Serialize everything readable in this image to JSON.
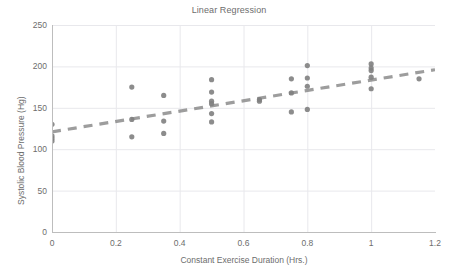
{
  "chart_data": {
    "type": "scatter",
    "title": "Linear Regression",
    "xlabel": "Constant Exercise Duration (Hrs.)",
    "ylabel": "Systolic Blood Pressure (Hg)",
    "xlim": [
      0,
      1.2
    ],
    "ylim": [
      0,
      250
    ],
    "xticks": [
      0,
      0.2,
      0.4,
      0.6,
      0.8,
      1,
      1.2
    ],
    "xtick_labels": [
      "0",
      "0.2",
      "0.4",
      "0.6",
      "0.8",
      "1",
      "1.2"
    ],
    "yticks": [
      0,
      50,
      100,
      150,
      200,
      250
    ],
    "ytick_labels": [
      "0",
      "50",
      "100",
      "150",
      "200",
      "250"
    ],
    "grid": true,
    "legend": null,
    "marker_color": "#808080",
    "trendline_color": "#8c8c8c",
    "grid_color": "#e8e8ec",
    "axis_color": "#bdbdbd",
    "text_color": "#6d6d6d",
    "background": "#ffffff",
    "series": [
      {
        "name": "Observations",
        "marker": "circle",
        "points": [
          [
            0.0,
            130
          ],
          [
            0.0,
            116
          ],
          [
            0.0,
            113
          ],
          [
            0.0,
            110
          ],
          [
            0.25,
            175
          ],
          [
            0.25,
            136
          ],
          [
            0.25,
            115
          ],
          [
            0.35,
            165
          ],
          [
            0.35,
            134
          ],
          [
            0.35,
            119
          ],
          [
            0.5,
            184
          ],
          [
            0.5,
            169
          ],
          [
            0.5,
            158
          ],
          [
            0.5,
            155
          ],
          [
            0.5,
            143
          ],
          [
            0.5,
            133
          ],
          [
            0.65,
            160
          ],
          [
            0.65,
            158
          ],
          [
            0.75,
            185
          ],
          [
            0.75,
            168
          ],
          [
            0.75,
            145
          ],
          [
            0.8,
            201
          ],
          [
            0.8,
            186
          ],
          [
            0.8,
            176
          ],
          [
            0.8,
            148
          ],
          [
            1.0,
            203
          ],
          [
            1.0,
            198
          ],
          [
            1.0,
            195
          ],
          [
            1.0,
            187
          ],
          [
            1.0,
            173
          ],
          [
            1.15,
            185
          ]
        ]
      }
    ],
    "trendline": {
      "name": "Linear fit",
      "style": "dashed",
      "x_start": 0.0,
      "y_start": 121,
      "x_end": 1.2,
      "y_end": 196
    }
  }
}
